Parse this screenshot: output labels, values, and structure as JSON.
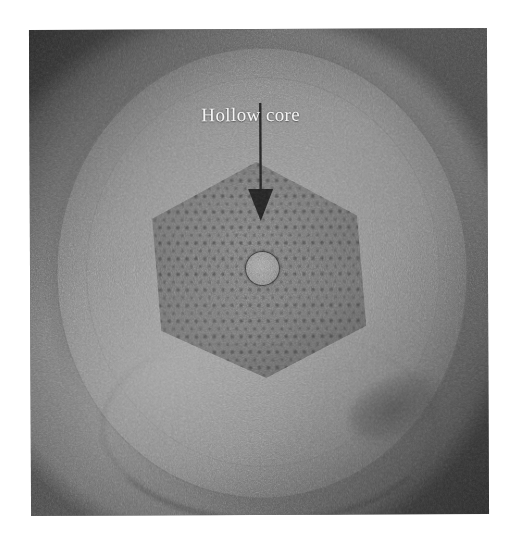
{
  "figure": {
    "kind": "micrograph",
    "background_color": "#ffffff",
    "photo": {
      "left": 30,
      "top": 29,
      "width": 458,
      "height": 486,
      "base_color": "#6e6e6e",
      "rotation_deg": -0.25
    }
  },
  "annotations": {
    "label_text": "Hollow core",
    "label_color": "#f2f2f2",
    "arrow_color": "#1f1f1f",
    "arrow": {
      "shaft_top_y": 133,
      "shaft_bottom_y": 218,
      "head_tip_y": 243,
      "x": 261
    }
  },
  "features": {
    "hollow_core": {
      "center_x": 261,
      "center_y": 268,
      "radius": 16,
      "outline_color": "#262626",
      "fill_color": "#929292"
    },
    "hexagon_region": {
      "center_x": 257,
      "center_y": 270,
      "width": 218,
      "height": 216,
      "fill_color": "#4a4a4a"
    },
    "cladding_circle": {
      "center_x": 262,
      "center_y": 273,
      "width": 412,
      "height": 452,
      "edge_color": "#464646"
    }
  }
}
